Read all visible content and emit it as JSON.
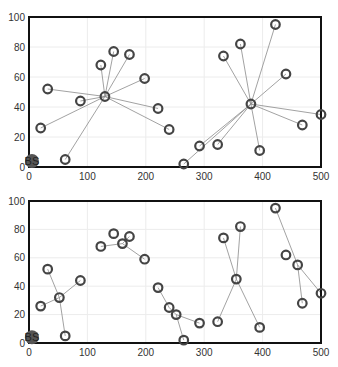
{
  "chart_data": [
    {
      "type": "scatter",
      "title": "",
      "xlabel": "",
      "ylabel": "",
      "xlim": [
        0,
        500
      ],
      "ylim": [
        0,
        100
      ],
      "xticks": [
        0,
        100,
        200,
        300,
        400,
        500
      ],
      "yticks": [
        0,
        20,
        40,
        60,
        80,
        100
      ],
      "grid": true,
      "base_station": {
        "label": "BS",
        "x": 5,
        "y": 4
      },
      "nodes": [
        [
          20,
          26
        ],
        [
          32,
          52
        ],
        [
          62,
          5
        ],
        [
          88,
          44
        ],
        [
          123,
          68
        ],
        [
          145,
          77
        ],
        [
          172,
          75
        ],
        [
          198,
          59
        ],
        [
          221,
          39
        ],
        [
          240,
          25
        ],
        [
          130,
          47
        ],
        [
          265,
          2
        ],
        [
          292,
          14
        ],
        [
          323,
          15
        ],
        [
          333,
          74
        ],
        [
          362,
          82
        ],
        [
          380,
          42
        ],
        [
          395,
          11
        ],
        [
          422,
          95
        ],
        [
          440,
          62
        ],
        [
          468,
          28
        ],
        [
          500,
          35
        ]
      ],
      "links": [
        [
          [
            130,
            47
          ],
          [
            20,
            26
          ]
        ],
        [
          [
            130,
            47
          ],
          [
            32,
            52
          ]
        ],
        [
          [
            130,
            47
          ],
          [
            62,
            5
          ]
        ],
        [
          [
            130,
            47
          ],
          [
            88,
            44
          ]
        ],
        [
          [
            130,
            47
          ],
          [
            123,
            68
          ]
        ],
        [
          [
            130,
            47
          ],
          [
            145,
            77
          ]
        ],
        [
          [
            130,
            47
          ],
          [
            172,
            75
          ]
        ],
        [
          [
            130,
            47
          ],
          [
            198,
            59
          ]
        ],
        [
          [
            130,
            47
          ],
          [
            221,
            39
          ]
        ],
        [
          [
            130,
            47
          ],
          [
            240,
            25
          ]
        ],
        [
          [
            380,
            42
          ],
          [
            265,
            2
          ]
        ],
        [
          [
            380,
            42
          ],
          [
            292,
            14
          ]
        ],
        [
          [
            380,
            42
          ],
          [
            323,
            15
          ]
        ],
        [
          [
            380,
            42
          ],
          [
            333,
            74
          ]
        ],
        [
          [
            380,
            42
          ],
          [
            362,
            82
          ]
        ],
        [
          [
            380,
            42
          ],
          [
            395,
            11
          ]
        ],
        [
          [
            380,
            42
          ],
          [
            422,
            95
          ]
        ],
        [
          [
            380,
            42
          ],
          [
            440,
            62
          ]
        ],
        [
          [
            380,
            42
          ],
          [
            468,
            28
          ]
        ],
        [
          [
            380,
            42
          ],
          [
            500,
            35
          ]
        ]
      ]
    },
    {
      "type": "scatter",
      "title": "",
      "xlabel": "",
      "ylabel": "",
      "xlim": [
        0,
        500
      ],
      "ylim": [
        0,
        100
      ],
      "xticks": [
        0,
        100,
        200,
        300,
        400,
        500
      ],
      "yticks": [
        0,
        20,
        40,
        60,
        80,
        100
      ],
      "grid": true,
      "base_station": {
        "label": "BS",
        "x": 5,
        "y": 4
      },
      "nodes": [
        [
          20,
          26
        ],
        [
          32,
          52
        ],
        [
          52,
          32
        ],
        [
          62,
          5
        ],
        [
          88,
          44
        ],
        [
          123,
          68
        ],
        [
          145,
          77
        ],
        [
          160,
          70
        ],
        [
          172,
          75
        ],
        [
          198,
          59
        ],
        [
          221,
          39
        ],
        [
          240,
          25
        ],
        [
          252,
          20
        ],
        [
          265,
          2
        ],
        [
          292,
          14
        ],
        [
          323,
          15
        ],
        [
          333,
          74
        ],
        [
          355,
          45
        ],
        [
          362,
          82
        ],
        [
          395,
          11
        ],
        [
          422,
          95
        ],
        [
          440,
          62
        ],
        [
          460,
          55
        ],
        [
          468,
          28
        ],
        [
          500,
          35
        ]
      ],
      "links": [
        [
          [
            52,
            32
          ],
          [
            20,
            26
          ]
        ],
        [
          [
            52,
            32
          ],
          [
            32,
            52
          ]
        ],
        [
          [
            52,
            32
          ],
          [
            62,
            5
          ]
        ],
        [
          [
            52,
            32
          ],
          [
            88,
            44
          ]
        ],
        [
          [
            160,
            70
          ],
          [
            123,
            68
          ]
        ],
        [
          [
            160,
            70
          ],
          [
            172,
            75
          ]
        ],
        [
          [
            160,
            70
          ],
          [
            198,
            59
          ]
        ],
        [
          [
            221,
            39
          ],
          [
            240,
            25
          ]
        ],
        [
          [
            240,
            25
          ],
          [
            252,
            20
          ]
        ],
        [
          [
            252,
            20
          ],
          [
            265,
            2
          ]
        ],
        [
          [
            252,
            20
          ],
          [
            292,
            14
          ]
        ],
        [
          [
            355,
            45
          ],
          [
            323,
            15
          ]
        ],
        [
          [
            355,
            45
          ],
          [
            333,
            74
          ]
        ],
        [
          [
            355,
            45
          ],
          [
            362,
            82
          ]
        ],
        [
          [
            355,
            45
          ],
          [
            395,
            11
          ]
        ],
        [
          [
            460,
            55
          ],
          [
            422,
            95
          ]
        ],
        [
          [
            460,
            55
          ],
          [
            468,
            28
          ]
        ],
        [
          [
            460,
            55
          ],
          [
            500,
            35
          ]
        ]
      ]
    }
  ]
}
